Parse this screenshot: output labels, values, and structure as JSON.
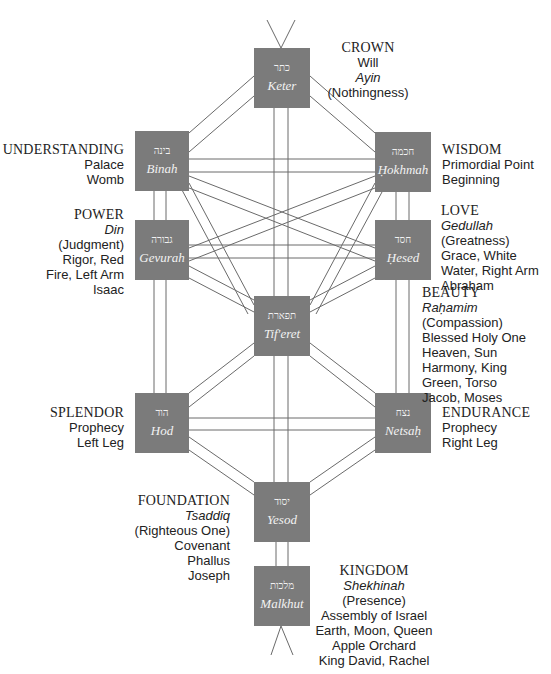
{
  "diagram": {
    "type": "Kabbalistic Tree of Life (Sefirot)",
    "colors": {
      "node_fill": "#7b7b7b",
      "node_text": "#f2f2f2",
      "channel_stroke": "#6a6a6a",
      "label_text": "#222222"
    },
    "nodes": {
      "keter": {
        "hebrew": "כתר",
        "name": "Keter"
      },
      "binah": {
        "hebrew": "בינה",
        "name": "Binah"
      },
      "hokhmah": {
        "hebrew": "חכמה",
        "name": "Ḥokhmah"
      },
      "gevurah": {
        "hebrew": "גבורה",
        "name": "Gevurah"
      },
      "hesed": {
        "hebrew": "חסד",
        "name": "Ḥesed"
      },
      "tiferet": {
        "hebrew": "תפארת",
        "name": "Tif'eret"
      },
      "hod": {
        "hebrew": "הוד",
        "name": "Hod"
      },
      "netsah": {
        "hebrew": "נצח",
        "name": "Netsaḥ"
      },
      "yesod": {
        "hebrew": "יסוד",
        "name": "Yesod"
      },
      "malkhut": {
        "hebrew": "מלכות",
        "name": "Malkhut"
      }
    },
    "labels": {
      "keter": {
        "title": "CROWN",
        "lines": [
          "Will",
          "Ayin",
          "(Nothingness)"
        ]
      },
      "binah": {
        "title": "UNDERSTANDING",
        "lines": [
          "Palace",
          "Womb"
        ]
      },
      "hokhmah": {
        "title": "WISDOM",
        "lines": [
          "Primordial Point",
          "Beginning"
        ]
      },
      "gevurah": {
        "title": "POWER",
        "lines": [
          "Din",
          "(Judgment)",
          "Rigor, Red",
          "Fire, Left Arm",
          "Isaac"
        ]
      },
      "hesed": {
        "title": "LOVE",
        "lines": [
          "Gedullah",
          "(Greatness)",
          "Grace, White",
          "Water, Right Arm",
          "Abraham"
        ]
      },
      "tiferet": {
        "title": "BEAUTY",
        "lines": [
          "Raḥamim",
          "(Compassion)",
          "Blessed Holy One",
          "Heaven, Sun",
          "Harmony, King",
          "Green, Torso",
          "Jacob, Moses"
        ]
      },
      "hod": {
        "title": "SPLENDOR",
        "lines": [
          "Prophecy",
          "Left Leg"
        ]
      },
      "netsah": {
        "title": "ENDURANCE",
        "lines": [
          "Prophecy",
          "Right Leg"
        ]
      },
      "yesod": {
        "title": "FOUNDATION",
        "lines": [
          "Tsaddiq",
          "(Righteous One)",
          "Covenant",
          "Phallus",
          "Joseph"
        ]
      },
      "malkhut": {
        "title": "KINGDOM",
        "lines": [
          "Shekhinah",
          "(Presence)",
          "Assembly of Israel",
          "Earth, Moon, Queen",
          "Apple Orchard",
          "King David, Rachel"
        ]
      }
    }
  }
}
